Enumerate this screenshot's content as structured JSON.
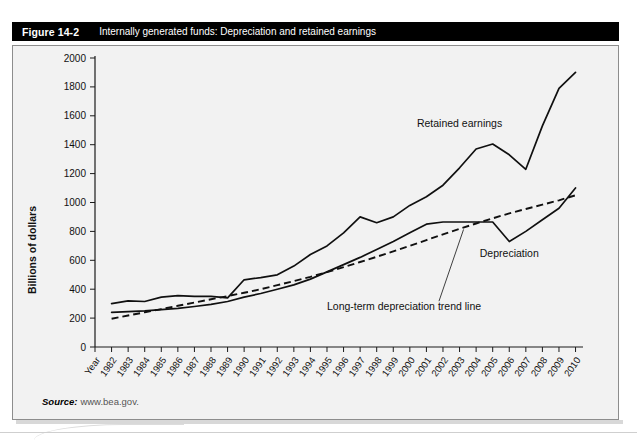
{
  "figure": {
    "number": "Figure 14-2",
    "caption": "Internally generated funds: Depreciation and retained earnings"
  },
  "source": {
    "label": "Source:",
    "url": "www.bea.gov."
  },
  "chart_data": {
    "type": "line",
    "title": "Internally generated funds: Depreciation and retained earnings",
    "xlabel": "Year",
    "ylabel": "Billions of dollars",
    "ylim": [
      0,
      2000
    ],
    "yticks": [
      0,
      200,
      400,
      600,
      800,
      1000,
      1200,
      1400,
      1600,
      1800,
      2000
    ],
    "grid": false,
    "legend_position": "inline-annotations",
    "x_axis_first_label": "Year",
    "categories": [
      "1982",
      "1983",
      "1984",
      "1985",
      "1986",
      "1987",
      "1988",
      "1989",
      "1990",
      "1991",
      "1992",
      "1993",
      "1994",
      "1995",
      "1996",
      "1997",
      "1998",
      "1999",
      "2000",
      "2001",
      "2002",
      "2003",
      "2004",
      "2005",
      "2006",
      "2007",
      "2008",
      "2009",
      "2010"
    ],
    "series": [
      {
        "name": "Retained earnings",
        "style": "solid",
        "values": [
          300,
          320,
          315,
          345,
          355,
          350,
          350,
          340,
          465,
          480,
          500,
          560,
          640,
          700,
          790,
          900,
          860,
          900,
          980,
          1040,
          1120,
          1240,
          1370,
          1405,
          1330,
          1230,
          1530,
          1790,
          1900
        ]
      },
      {
        "name": "Depreciation",
        "style": "solid",
        "values": [
          240,
          245,
          250,
          258,
          268,
          280,
          295,
          315,
          345,
          370,
          400,
          430,
          470,
          520,
          570,
          620,
          675,
          730,
          790,
          850,
          865,
          865,
          865,
          865,
          730,
          800,
          880,
          960,
          1100
        ]
      },
      {
        "name": "Long-term depreciation trend line",
        "style": "dashed",
        "values": [
          195,
          218,
          240,
          262,
          285,
          308,
          330,
          352,
          375,
          400,
          428,
          456,
          486,
          518,
          552,
          588,
          624,
          662,
          700,
          740,
          780,
          818,
          855,
          890,
          925,
          955,
          985,
          1015,
          1050
        ]
      }
    ],
    "annotations": [
      {
        "text": "Retained earnings",
        "x_year": "2003",
        "y_value": 1520
      },
      {
        "text": "Depreciation",
        "x_year": "2006",
        "y_value": 620
      },
      {
        "text": "Long-term depreciation trend line",
        "x_year": "1995",
        "y_value": 255
      }
    ]
  }
}
